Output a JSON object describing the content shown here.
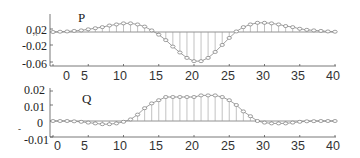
{
  "chart_data": [
    {
      "type": "stem",
      "title": "P",
      "x": [
        0,
        1,
        2,
        3,
        4,
        5,
        6,
        7,
        8,
        9,
        10,
        11,
        12,
        13,
        14,
        15,
        16,
        17,
        18,
        19,
        20,
        21,
        22,
        23,
        24,
        25,
        26,
        27,
        28,
        29,
        30,
        31,
        32,
        33,
        34,
        35,
        36,
        37,
        38,
        39,
        40
      ],
      "values": [
        0.0,
        0.0005,
        0.001,
        0.002,
        0.003,
        0.005,
        0.007,
        0.009,
        0.012,
        0.014,
        0.016,
        0.016,
        0.014,
        0.01,
        0.003,
        -0.005,
        -0.015,
        -0.027,
        -0.038,
        -0.048,
        -0.054,
        -0.054,
        -0.048,
        -0.037,
        -0.024,
        -0.011,
        0.001,
        0.009,
        0.014,
        0.017,
        0.017,
        0.016,
        0.014,
        0.011,
        0.009,
        0.006,
        0.004,
        0.003,
        0.002,
        0.001,
        0.0005
      ],
      "yticks": [
        "0.02",
        "-0.02",
        "-0.06"
      ],
      "xticks": [
        "0",
        "5",
        "10",
        "15",
        "20",
        "25",
        "30",
        "35",
        "40"
      ],
      "xlim": [
        0,
        40
      ],
      "ylim": [
        -0.06,
        0.03
      ]
    },
    {
      "type": "stem",
      "title": "Q",
      "x": [
        0,
        1,
        2,
        3,
        4,
        5,
        6,
        7,
        8,
        9,
        10,
        11,
        12,
        13,
        14,
        15,
        16,
        17,
        18,
        19,
        20,
        21,
        22,
        23,
        24,
        25,
        26,
        27,
        28,
        29,
        30,
        31,
        32,
        33,
        34,
        35,
        36,
        37,
        38,
        39,
        40
      ],
      "values": [
        0.0,
        0.0,
        0.0,
        -0.0002,
        -0.0005,
        -0.001,
        -0.0015,
        -0.002,
        -0.002,
        -0.0015,
        -0.0005,
        0.001,
        0.004,
        0.008,
        0.011,
        0.013,
        0.015,
        0.015,
        0.015,
        0.015,
        0.015,
        0.016,
        0.016,
        0.016,
        0.015,
        0.013,
        0.01,
        0.006,
        0.003,
        0.0,
        -0.001,
        -0.0015,
        -0.0015,
        -0.0015,
        -0.001,
        -0.0005,
        -0.0002,
        -0.0001,
        0.0,
        0.0,
        0.0
      ],
      "yticks": [
        "0.02",
        "0.01",
        "0",
        "-0.01"
      ],
      "xticks": [
        "0",
        "5",
        "10",
        "15",
        "20",
        "25",
        "30",
        "35",
        "40"
      ],
      "xlim": [
        0,
        40
      ],
      "ylim": [
        -0.01,
        0.02
      ]
    }
  ]
}
